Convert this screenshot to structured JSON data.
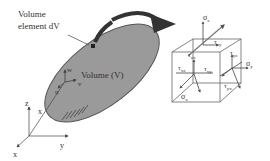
{
  "figure": {
    "labels": {
      "volume_element_line1": "Volume",
      "volume_element_line2": "element dV",
      "volume": "Volume (V)",
      "local_u": "u",
      "local_v": "v",
      "local_w": "w",
      "global_x": "x",
      "global_y": "y",
      "global_z": "z",
      "position_x": "x"
    },
    "stress_cube": {
      "sigma_z": "σ",
      "sigma_z_sub": "z",
      "sigma_y": "σ",
      "sigma_y_sub": "y",
      "sigma_x": "σ",
      "sigma_x_sub": "x",
      "tau_zy": "τ",
      "tau_zy_sub": "zy",
      "tau_zx": "τ",
      "tau_zx_sub": "zx",
      "tau_yz": "τ",
      "tau_yz_sub": "yz",
      "tau_xz": "τ",
      "tau_xz_sub": "xz",
      "tau_xy": "τ",
      "tau_xy_sub": "xy",
      "tau_yx": "τ",
      "tau_yx_sub": "yx"
    },
    "colors": {
      "body_fill": "#9a9a9a",
      "body_stroke": "#555555",
      "arrow": "#3a3a3a",
      "line": "#444444",
      "stress_arrow": "#555555"
    }
  }
}
